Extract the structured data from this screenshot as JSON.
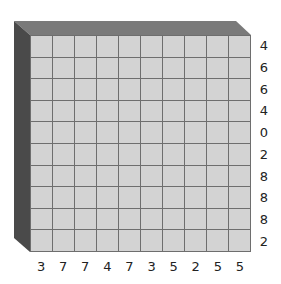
{
  "puzzle": {
    "rows": 10,
    "cols": 10,
    "row_clues": [
      "4",
      "6",
      "6",
      "4",
      "0",
      "2",
      "8",
      "8",
      "8",
      "2"
    ],
    "col_clues": [
      "3",
      "7",
      "7",
      "4",
      "7",
      "3",
      "5",
      "2",
      "5",
      "5"
    ],
    "colors": {
      "cell": "#d3d3d3",
      "grid_line": "#6e6e6e",
      "top_bevel": "#7a7a7a",
      "left_bevel": "#4a4a4a",
      "clue_text": "#222222"
    }
  }
}
